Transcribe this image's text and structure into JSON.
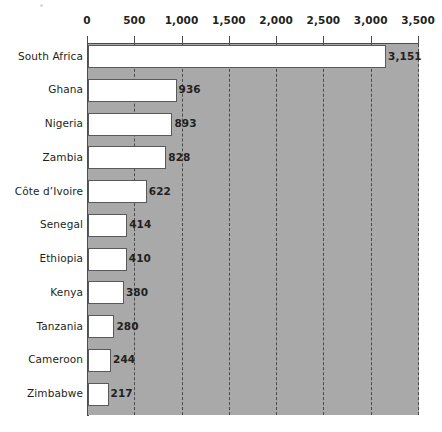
{
  "chart_data": {
    "type": "bar",
    "orientation": "horizontal",
    "title": "",
    "subtitle": "",
    "xlabel": "",
    "ylabel": "",
    "xlim": [
      0,
      3500
    ],
    "grid": true,
    "grid_style": "dashed-vertical",
    "legend": "none",
    "axis_position": "top",
    "categories": [
      "South Africa",
      "Ghana",
      "Nigeria",
      "Zambia",
      "Côte d’Ivoire",
      "Senegal",
      "Ethiopia",
      "Kenya",
      "Tanzania",
      "Cameroon",
      "Zimbabwe"
    ],
    "values": [
      3151,
      936,
      893,
      828,
      622,
      414,
      410,
      380,
      280,
      244,
      217
    ],
    "value_labels": [
      "3,151",
      "936",
      "893",
      "828",
      "622",
      "414",
      "410",
      "380",
      "280",
      "244",
      "217"
    ],
    "ticks": [
      0,
      500,
      1000,
      1500,
      2000,
      2500,
      3000,
      3500
    ],
    "tick_labels": [
      "0",
      "500",
      "1,000",
      "1,500",
      "2,000",
      "2,500",
      "3,000",
      "3,500"
    ],
    "colors": {
      "bar_fill": "#ffffff",
      "bar_border": "#58595b",
      "plot_background": "#a9a9a9",
      "gridline": "#4a4a4a",
      "axis": "#4d4d4d",
      "text": "#231f20",
      "page_background": "#ffffff"
    }
  }
}
